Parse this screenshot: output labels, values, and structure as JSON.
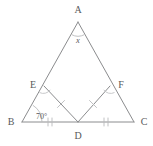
{
  "figure": {
    "kind": "geometry-diagram",
    "stroke_color": "#8b8c8e",
    "mark_color": "#b9babc",
    "text_color": "#58595b",
    "background_color": "#ffffff"
  },
  "vertices": [
    {
      "id": "A",
      "label": "A",
      "x": 78,
      "y": 22,
      "label_x": 78,
      "label_y": 13
    },
    {
      "id": "B",
      "label": "B",
      "x": 22,
      "y": 122,
      "label_x": 11,
      "label_y": 125
    },
    {
      "id": "C",
      "label": "C",
      "x": 134,
      "y": 122,
      "label_x": 144,
      "label_y": 125
    },
    {
      "id": "D",
      "label": "D",
      "x": 78,
      "y": 122,
      "label_x": 78,
      "label_y": 139
    },
    {
      "id": "E",
      "label": "E",
      "x": 44,
      "y": 86,
      "label_x": 33,
      "label_y": 88
    },
    {
      "id": "F",
      "label": "F",
      "x": 110,
      "y": 86,
      "label_x": 121,
      "label_y": 88
    }
  ],
  "segments": [
    {
      "id": "AB",
      "from": "A",
      "to": "B"
    },
    {
      "id": "AC",
      "from": "A",
      "to": "C"
    },
    {
      "id": "BC",
      "from": "B",
      "to": "C"
    },
    {
      "id": "ED",
      "from": "E",
      "to": "D"
    },
    {
      "id": "FD",
      "from": "F",
      "to": "D"
    }
  ],
  "angles": [
    {
      "id": "angle-A",
      "at": "A",
      "label": "x",
      "type": "variable"
    },
    {
      "id": "angle-B",
      "at": "B",
      "label": "70°",
      "value": 70,
      "unit": "degrees"
    },
    {
      "id": "angle-E",
      "at": "E",
      "label": "",
      "type": "right-angle-mark"
    },
    {
      "id": "angle-F",
      "at": "F",
      "label": "",
      "type": "right-angle-mark"
    }
  ],
  "tick_marks": [
    {
      "id": "tick-BD",
      "segment": "BD",
      "count": 2
    },
    {
      "id": "tick-DC",
      "segment": "DC",
      "count": 2
    },
    {
      "id": "tick-ED",
      "segment": "ED",
      "count": 1
    },
    {
      "id": "tick-FD",
      "segment": "FD",
      "count": 1
    }
  ]
}
